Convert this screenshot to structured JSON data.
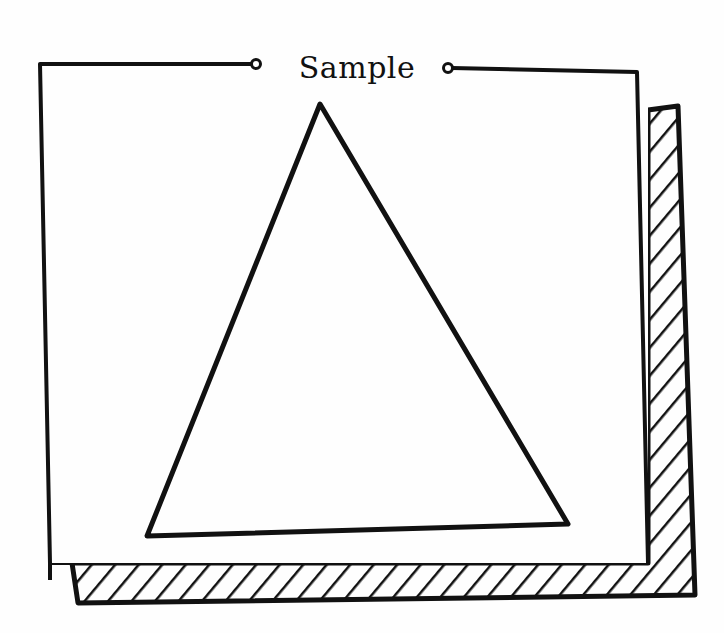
{
  "panel": {
    "title": "Sample",
    "shape": "triangle",
    "stroke_color": "#111111",
    "background_color": "#fefefe",
    "shadow_style": "hatched"
  }
}
